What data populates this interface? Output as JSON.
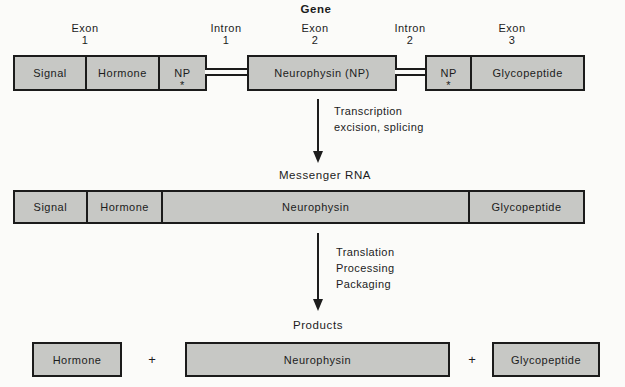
{
  "colors": {
    "box_fill": "#c7c8c5",
    "box_border": "#1b1b1b",
    "background": "#fbfbf9",
    "text": "#1c1c1c"
  },
  "gene_section": {
    "title": "Gene",
    "region_labels": [
      {
        "name": "Exon",
        "number": "1"
      },
      {
        "name": "Intron",
        "number": "1"
      },
      {
        "name": "Exon",
        "number": "2"
      },
      {
        "name": "Intron",
        "number": "2"
      },
      {
        "name": "Exon",
        "number": "3"
      }
    ],
    "segments": [
      {
        "label": "Signal"
      },
      {
        "label": "Hormone"
      },
      {
        "label": "NP",
        "marker": "*"
      },
      {
        "label": "Neurophysin (NP)"
      },
      {
        "label": "NP",
        "marker": "*"
      },
      {
        "label": "Glycopeptide"
      }
    ]
  },
  "transcription_step": {
    "line1": "Transcription",
    "line2": "excision, splicing"
  },
  "mrna_section": {
    "title": "Messenger RNA",
    "segments": [
      {
        "label": "Signal"
      },
      {
        "label": "Hormone"
      },
      {
        "label": "Neurophysin"
      },
      {
        "label": "Glycopeptide"
      }
    ]
  },
  "translation_step": {
    "line1": "Translation",
    "line2": "Processing",
    "line3": "Packaging"
  },
  "products_section": {
    "title": "Products",
    "plus": "+",
    "segments": [
      {
        "label": "Hormone"
      },
      {
        "label": "Neurophysin"
      },
      {
        "label": "Glycopeptide"
      }
    ]
  }
}
